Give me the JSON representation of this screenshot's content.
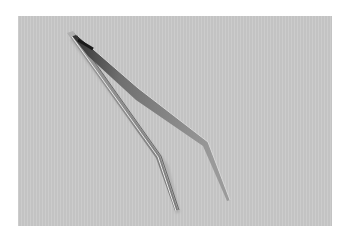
{
  "image": {
    "subject": "stainless steel tweezers with bent tips",
    "background_color": "#c9c9c9",
    "border_color": "#ffffff",
    "metal_dark": "#3a3a3a",
    "metal_mid": "#8a8a8a",
    "metal_light": "#dedede"
  }
}
